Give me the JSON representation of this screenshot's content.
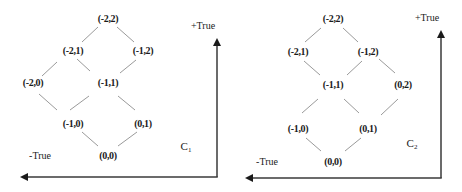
{
  "diagrams": [
    {
      "name": "C",
      "subscript": "1",
      "axis": {
        "positive_label": "+True",
        "negative_label": "-True",
        "corner": [
          217,
          177
        ],
        "top": [
          217,
          38
        ],
        "left": [
          20,
          177
        ]
      },
      "label_pos": [
        186,
        148
      ],
      "positive_label_pos": [
        203,
        26
      ],
      "negative_label_pos": [
        40,
        156
      ],
      "nodes": [
        {
          "id": "-2,2",
          "label": "(-2,2)",
          "x": 108,
          "y": 19
        },
        {
          "id": "-2,1",
          "label": "(-2,1)",
          "x": 73,
          "y": 51
        },
        {
          "id": "-1,2",
          "label": "(-1,2)",
          "x": 143,
          "y": 51
        },
        {
          "id": "-2,0",
          "label": "(-2,0)",
          "x": 33,
          "y": 83
        },
        {
          "id": "-1,1",
          "label": "(-1,1)",
          "x": 108,
          "y": 83
        },
        {
          "id": "-1,0",
          "label": "(-1,0)",
          "x": 73,
          "y": 124
        },
        {
          "id": "0,1",
          "label": "(0,1)",
          "x": 143,
          "y": 124
        },
        {
          "id": "0,0",
          "label": "(0,0)",
          "x": 108,
          "y": 156
        }
      ],
      "edges": [
        {
          "from": [
            98,
            27
          ],
          "to": [
            82,
            42
          ]
        },
        {
          "from": [
            117,
            27
          ],
          "to": [
            134,
            42
          ]
        },
        {
          "from": [
            57,
            62
          ],
          "to": [
            42,
            76
          ]
        },
        {
          "from": [
            77,
            59
          ],
          "to": [
            90,
            71
          ]
        },
        {
          "from": [
            136,
            60
          ],
          "to": [
            120,
            73
          ]
        },
        {
          "from": [
            39,
            94
          ],
          "to": [
            57,
            110
          ]
        },
        {
          "from": [
            89,
            96
          ],
          "to": [
            70,
            110
          ]
        },
        {
          "from": [
            118,
            96
          ],
          "to": [
            135,
            110
          ]
        },
        {
          "from": [
            82,
            132
          ],
          "to": [
            98,
            146
          ]
        },
        {
          "from": [
            137,
            132
          ],
          "to": [
            118,
            146
          ]
        }
      ]
    },
    {
      "name": "C",
      "subscript": "2",
      "axis": {
        "positive_label": "+True",
        "negative_label": "-True",
        "corner": [
          441,
          178
        ],
        "top": [
          441,
          30
        ],
        "left": [
          245,
          178
        ]
      },
      "label_pos": [
        412,
        145
      ],
      "positive_label_pos": [
        427,
        18
      ],
      "negative_label_pos": [
        267,
        162
      ],
      "nodes": [
        {
          "id": "-2,2",
          "label": "(-2,2)",
          "x": 333,
          "y": 19
        },
        {
          "id": "-2,1",
          "label": "(-2,1)",
          "x": 298,
          "y": 52
        },
        {
          "id": "-1,2",
          "label": "(-1,2)",
          "x": 368,
          "y": 52
        },
        {
          "id": "-1,1",
          "label": "(-1,1)",
          "x": 333,
          "y": 85
        },
        {
          "id": "0,2",
          "label": "(0,2)",
          "x": 403,
          "y": 85
        },
        {
          "id": "-1,0",
          "label": "(-1,0)",
          "x": 298,
          "y": 129
        },
        {
          "id": "0,1",
          "label": "(0,1)",
          "x": 368,
          "y": 129
        },
        {
          "id": "0,0",
          "label": "(0,0)",
          "x": 333,
          "y": 162
        }
      ],
      "edges": [
        {
          "from": [
            321,
            28
          ],
          "to": [
            305,
            42
          ]
        },
        {
          "from": [
            343,
            28
          ],
          "to": [
            358,
            42
          ]
        },
        {
          "from": [
            304,
            61
          ],
          "to": [
            320,
            75
          ]
        },
        {
          "from": [
            362,
            61
          ],
          "to": [
            347,
            75
          ]
        },
        {
          "from": [
            379,
            59
          ],
          "to": [
            395,
            73
          ]
        },
        {
          "from": [
            318,
            99
          ],
          "to": [
            302,
            113
          ]
        },
        {
          "from": [
            344,
            99
          ],
          "to": [
            359,
            113
          ]
        },
        {
          "from": [
            398,
            99
          ],
          "to": [
            381,
            115
          ]
        },
        {
          "from": [
            306,
            138
          ],
          "to": [
            321,
            151
          ]
        },
        {
          "from": [
            361,
            138
          ],
          "to": [
            345,
            151
          ]
        }
      ]
    }
  ],
  "colors": {
    "edge": "#9a9a9a",
    "axis": "#3a3a3a",
    "text": "#1a1a1a",
    "background": "#ffffff"
  }
}
